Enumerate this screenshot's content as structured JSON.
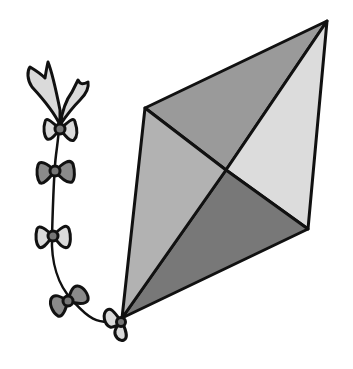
{
  "illustration": {
    "subject": "kite with bow tail",
    "colors": {
      "background": "#ffffff",
      "outline": "#111111",
      "panel_top": "#9a9a9a",
      "panel_right": "#dcdcdc",
      "panel_bottom": "#787878",
      "panel_left": "#b2b2b2",
      "bow_light": "#dadada",
      "bow_dark": "#8a8a8a",
      "knot": "#777777"
    },
    "kite": {
      "vertices": {
        "left": [
          145,
          108
        ],
        "top": [
          327,
          21
        ],
        "right": [
          308,
          229
        ],
        "bottom": [
          122,
          318
        ],
        "center": [
          226,
          170
        ]
      }
    },
    "tail_bows": [
      {
        "cx": 60,
        "cy": 129,
        "tone": "light"
      },
      {
        "cx": 55,
        "cy": 171,
        "tone": "dark"
      },
      {
        "cx": 53,
        "cy": 236,
        "tone": "light"
      },
      {
        "cx": 68,
        "cy": 301,
        "tone": "dark"
      },
      {
        "cx": 122,
        "cy": 322,
        "tone": "light"
      }
    ]
  }
}
